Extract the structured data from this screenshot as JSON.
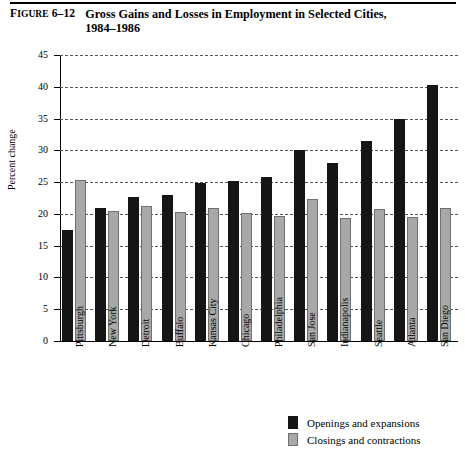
{
  "header": {
    "figure_label_caps": "F",
    "figure_label_rest": "IGURE",
    "figure_number": "6–12",
    "title_line1": "Gross Gains and Losses in Employment in Selected Cities,",
    "title_line2": "1984–1986"
  },
  "legend": {
    "items": [
      {
        "key": "openings",
        "label": "Openings and expansions",
        "color": "#151515"
      },
      {
        "key": "closings",
        "label": "Closings and contractions",
        "color": "#a8a8a8"
      }
    ]
  },
  "chart_data": {
    "type": "bar",
    "title": "Gross Gains and Losses in Employment in Selected Cities, 1984–1986",
    "xlabel": "",
    "ylabel": "Percent change",
    "ylim": [
      0,
      45
    ],
    "yticks": [
      0,
      5,
      10,
      15,
      20,
      25,
      30,
      35,
      40,
      45
    ],
    "ytick_labels": [
      "0",
      "5",
      "10",
      "15",
      "20",
      "25",
      "30",
      "35",
      "40",
      "45"
    ],
    "grid": true,
    "grid_style": "dashed-horizontal",
    "legend_position": "bottom-right",
    "categories": [
      "Pittsburgh",
      "New York",
      "Detroit",
      "Buffalo",
      "Kansas City",
      "Chicago",
      "Philadelphia",
      "San Jose",
      "Indianapolis",
      "Seattle",
      "Atlanta",
      "San Diego"
    ],
    "series": [
      {
        "name": "Openings and expansions",
        "color": "#151515",
        "values": [
          17.4,
          21.0,
          22.7,
          23.0,
          24.8,
          25.2,
          25.8,
          30.0,
          28.0,
          31.4,
          35.0,
          40.3
        ]
      },
      {
        "name": "Closings and contractions",
        "color": "#a8a8a8",
        "values": [
          25.4,
          20.5,
          21.3,
          20.3,
          21.0,
          20.1,
          19.6,
          22.3,
          19.4,
          20.7,
          19.5,
          20.9
        ]
      }
    ]
  }
}
